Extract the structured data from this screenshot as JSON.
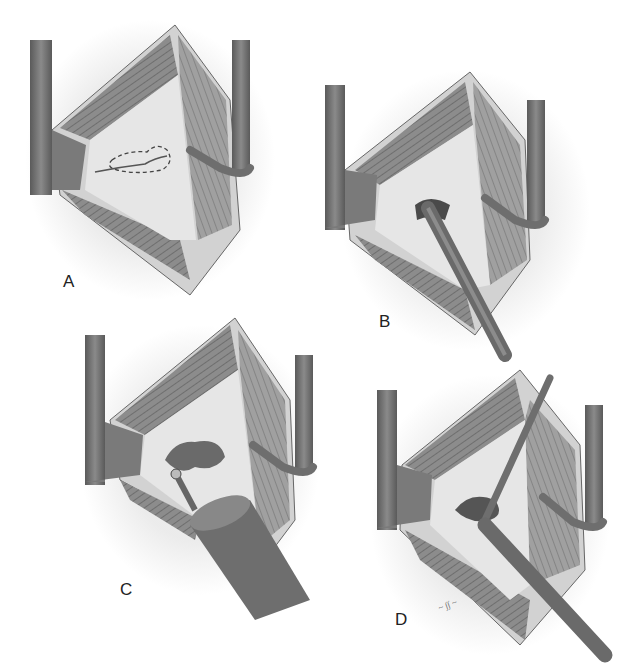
{
  "figure": {
    "type": "surgical-illustration",
    "style": "grayscale pencil rendering",
    "panels": [
      {
        "id": "A",
        "label": "A",
        "description": "Retracted incision exposing bone surface; dashed outline marks area of planned removal"
      },
      {
        "id": "B",
        "label": "B",
        "description": "Rongeur instrument biting into marked area"
      },
      {
        "id": "C",
        "label": "C",
        "description": "High-speed burr drilling the defect"
      },
      {
        "id": "D",
        "label": "D",
        "description": "Two instruments (probe and rongeur) working within the opened defect"
      }
    ],
    "signature": "artist signature",
    "colors": {
      "background": "#ffffff",
      "retractor": "#6e6e6e",
      "muscle": "#8a8a8a",
      "bone": "#e4e4e4",
      "skin_edge": "#cfcfcf"
    }
  }
}
